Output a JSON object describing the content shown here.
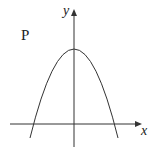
{
  "diagram": {
    "curve_label": "P",
    "x_axis_label": "x",
    "y_axis_label": "y",
    "curve_type": "downward parabola",
    "colors": {
      "stroke": "#333333",
      "background": "#ffffff"
    }
  }
}
